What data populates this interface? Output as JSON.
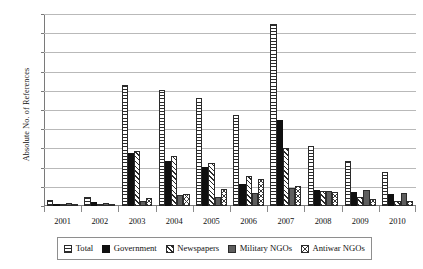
{
  "chart_data": {
    "type": "bar",
    "title": "",
    "xlabel": "",
    "ylabel": "Absolute No. of References",
    "ylim": [
      0,
      500
    ],
    "ytick_step": 50,
    "yticks": [
      500,
      450,
      400,
      350,
      300,
      250,
      200,
      150,
      100,
      50,
      0
    ],
    "grid": true,
    "legend_position": "bottom",
    "categories": [
      "2001",
      "2002",
      "2003",
      "2004",
      "2005",
      "2006",
      "2007",
      "2008",
      "2009",
      "2010"
    ],
    "series": [
      {
        "name": "Total",
        "pattern": "horizontal-lines",
        "color": "#ffffff",
        "values": [
          15,
          23,
          316,
          303,
          282,
          237,
          475,
          156,
          117,
          89
        ]
      },
      {
        "name": "Government",
        "pattern": "solid-black",
        "color": "#101010",
        "values": [
          3,
          10,
          138,
          116,
          101,
          57,
          225,
          43,
          36,
          30
        ]
      },
      {
        "name": "Newspapers",
        "pattern": "diagonal-hatch",
        "color": "#ffffff",
        "values": [
          2,
          2,
          144,
          129,
          112,
          77,
          152,
          40,
          23,
          12
        ]
      },
      {
        "name": "Military NGOs",
        "pattern": "solid-gray",
        "color": "#5e5e5e",
        "values": [
          7,
          8,
          13,
          28,
          24,
          35,
          48,
          39,
          42,
          33
        ]
      },
      {
        "name": "Antiwar NGOs",
        "pattern": "cross-hatch",
        "color": "#ffffff",
        "values": [
          2,
          2,
          20,
          30,
          45,
          71,
          51,
          37,
          17,
          13
        ]
      }
    ]
  },
  "legend": {
    "items": [
      {
        "label": "Total"
      },
      {
        "label": "Government"
      },
      {
        "label": "Newspapers"
      },
      {
        "label": "Military NGOs"
      },
      {
        "label": "Antiwar NGOs"
      }
    ]
  }
}
